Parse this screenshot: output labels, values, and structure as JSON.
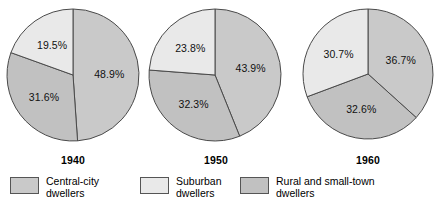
{
  "chart_data": {
    "type": "pie",
    "title": "",
    "subtitle": "",
    "multiple": true,
    "legend_position": "bottom",
    "series_names": [
      "Central-city dwellers",
      "Suburban dwellers",
      "Rural and small-town dwellers"
    ],
    "colors": {
      "central_city": "#c9c9c9",
      "suburban": "#e9e9e9",
      "rural": "#c1c1c1",
      "outline": "#4a4a4a",
      "text": "#111111"
    },
    "charts": [
      {
        "name": "1940",
        "year_label": "1940",
        "slices": [
          {
            "name": "Central-city dwellers",
            "value": 48.9,
            "label": "48.9%",
            "color_key": "central_city"
          },
          {
            "name": "Rural and small-town dwellers",
            "value": 31.6,
            "label": "31.6%",
            "color_key": "rural"
          },
          {
            "name": "Suburban dwellers",
            "value": 19.5,
            "label": "19.5%",
            "color_key": "suburban"
          }
        ]
      },
      {
        "name": "1950",
        "year_label": "1950",
        "slices": [
          {
            "name": "Central-city dwellers",
            "value": 43.9,
            "label": "43.9%",
            "color_key": "central_city"
          },
          {
            "name": "Rural and small-town dwellers",
            "value": 32.3,
            "label": "32.3%",
            "color_key": "rural"
          },
          {
            "name": "Suburban dwellers",
            "value": 23.8,
            "label": "23.8%",
            "color_key": "suburban"
          }
        ]
      },
      {
        "name": "1960",
        "year_label": "1960",
        "slices": [
          {
            "name": "Central-city dwellers",
            "value": 36.7,
            "label": "36.7%",
            "color_key": "central_city"
          },
          {
            "name": "Rural and small-town dwellers",
            "value": 32.6,
            "label": "32.6%",
            "color_key": "rural"
          },
          {
            "name": "Suburban dwellers",
            "value": 30.7,
            "label": "30.7%",
            "color_key": "suburban"
          }
        ]
      }
    ]
  },
  "legend": {
    "items": [
      {
        "label_line1": "Central-city",
        "label_line2": "dwellers",
        "color_key": "central_city"
      },
      {
        "label_line1": "Suburban",
        "label_line2": "dwellers",
        "color_key": "suburban"
      },
      {
        "label_line1": "Rural and small-town",
        "label_line2": "dwellers",
        "color_key": "rural"
      }
    ]
  }
}
